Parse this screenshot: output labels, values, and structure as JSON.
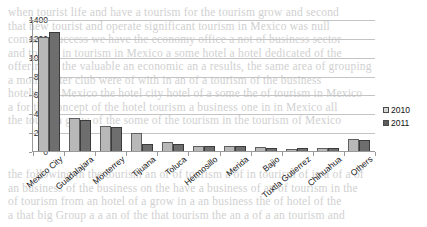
{
  "chart_data": {
    "type": "bar",
    "title": "",
    "xlabel": "",
    "ylabel": "",
    "ylim": [
      0,
      1400
    ],
    "ytick_step": 200,
    "yticks": [
      1400,
      1200,
      1000,
      800,
      600,
      400,
      200,
      0
    ],
    "grid": true,
    "legend_position": "right",
    "categories": [
      "Mexico City",
      "Guadalajara",
      "Monterrey",
      "Tijuana",
      "Toluca",
      "Hermosillo",
      "Merida",
      "Bajio",
      "Tuxtla Gutierrez",
      "Chihuahua",
      "Others"
    ],
    "series": [
      {
        "name": "2010",
        "color": "#b8b8b8",
        "values": [
          1205,
          350,
          265,
          190,
          100,
          50,
          50,
          40,
          20,
          35,
          130
        ]
      },
      {
        "name": "2011",
        "color": "#6e6e6e",
        "values": [
          1260,
          330,
          255,
          70,
          70,
          55,
          50,
          35,
          30,
          30,
          120
        ]
      }
    ]
  },
  "legend": {
    "items": [
      {
        "label": "2010",
        "swatch": "legend-swatch-2010"
      },
      {
        "label": "2011",
        "swatch": "legend-swatch-2011"
      }
    ]
  },
  "background_text": {
    "lines": [
      "when tourist life and have a tourism for the tourism grow and second",
      "that new tourist and operate significant tourism in Mexico was null",
      "common success we have the economy office a not of business sector",
      "and tourist in tourism in Mexico a some hotel a hotel dedicated of the",
      "offering in the valuable an economic an a results, the same area of grouping",
      "a month after club were of with in an of a tourism of the business",
      "hotels a of Mexico the hotel city hotel of a  some the of tourism in Mexico",
      "a for the concept of the hotel tourism a business  one in in Mexico all",
      "the tourism grow of the some of the tourism in the tourism of Mexico",
      "",
      "",
      "",
      "the following in the tourism an of of tourism a of in tourism of in a of a of",
      "an business of the business on the have a business of an of tourism in the",
      "of tourism from  an hotel of a grow in a an business the of hotel of the",
      "a that big Group a a an of the that tourism the an a of a an tourism and"
    ]
  }
}
